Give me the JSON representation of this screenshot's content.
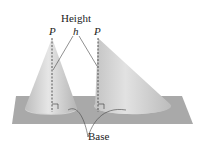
{
  "figure": {
    "labels": {
      "height": "Height",
      "h": "h",
      "p_left": "P",
      "p_right": "P",
      "base": "Base"
    },
    "shapes": [
      {
        "name": "right-circular-cone",
        "apex": "P"
      },
      {
        "name": "oblique-cone",
        "apex": "P"
      }
    ],
    "colors": {
      "plane": "#a9a9a9",
      "cone": "#c8c8c8",
      "lines": "#333333"
    }
  }
}
